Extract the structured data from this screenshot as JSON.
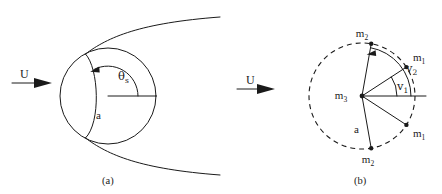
{
  "figure": {
    "background_color": "#ffffff",
    "line_color": "#1a1a1a",
    "width": 442,
    "height": 194
  },
  "panels": [
    {
      "id": "a",
      "caption": "(a)",
      "flow_label": "U",
      "labels": {
        "radius": "a",
        "separation_angle": "θ",
        "separation_angle_sub": "s"
      },
      "description": "Circle (cylinder) with separation streamline and wake curves; angle theta-s measured from the downstream horizontal radius.",
      "geometry": {
        "circle_center_x": 108,
        "circle_center_y": 96,
        "circle_radius": 48,
        "arc_radius": 30,
        "separation_angle_deg": 118
      }
    },
    {
      "id": "b",
      "caption": "(b)",
      "flow_label": "U",
      "labels": {
        "center_mass": "m",
        "center_mass_sub": "3",
        "mass_1": "m",
        "mass_1_sub": "1",
        "mass_2": "m",
        "mass_2_sub": "2",
        "radius": "a",
        "angle_1": "v",
        "angle_1_sub": "1",
        "angle_2": "v",
        "angle_2_sub": "2"
      },
      "description": "Dashed circle of radius a centred on m3, with point masses m1 and m2 placed symmetrically at angles v1 and v2 above and below the downstream axis.",
      "geometry": {
        "circle_center_x": 141,
        "circle_center_y": 96,
        "circle_radius": 53,
        "angle_1_deg": 33,
        "angle_2_deg": 80
      }
    }
  ],
  "nodes_panel_b": [
    {
      "name": "m2-top",
      "label": "m",
      "sub": "2",
      "angle_deg": 80,
      "label_dx": -2,
      "label_dy": -10
    },
    {
      "name": "m1-top",
      "label": "m",
      "sub": "1",
      "angle_deg": 33,
      "label_dx": 9,
      "label_dy": -5
    },
    {
      "name": "m1-bottom",
      "label": "m",
      "sub": "1",
      "angle_deg": -33,
      "label_dx": 9,
      "label_dy": 11
    },
    {
      "name": "m2-bottom",
      "label": "m",
      "sub": "2",
      "angle_deg": -80,
      "label_dx": -2,
      "label_dy": 15
    }
  ]
}
